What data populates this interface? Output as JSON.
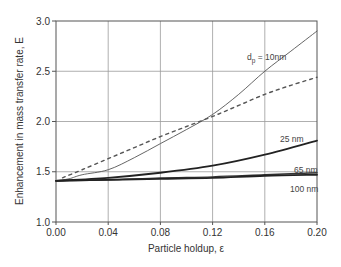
{
  "chart_data": {
    "type": "line",
    "title": "",
    "xlabel": "Particle holdup, ε",
    "ylabel": "Enhancement in mass transfer rate, E",
    "xlim": [
      0.0,
      0.2
    ],
    "ylim": [
      1.0,
      3.0
    ],
    "xticks": [
      "0.00",
      "0.04",
      "0.08",
      "0.12",
      "0.16",
      "0.20"
    ],
    "yticks": [
      "1.0",
      "1.5",
      "2.0",
      "2.5",
      "3.0"
    ],
    "grid": true,
    "legend": "inline labels at right end of curves",
    "series": [
      {
        "name": "d_p = 10nm",
        "style": "solid thin",
        "x": [
          0.0,
          0.01,
          0.02,
          0.04,
          0.06,
          0.08,
          0.1,
          0.12,
          0.14,
          0.16,
          0.18,
          0.2
        ],
        "y": [
          1.41,
          1.43,
          1.47,
          1.52,
          1.64,
          1.78,
          1.92,
          2.07,
          2.27,
          2.5,
          2.7,
          2.9
        ]
      },
      {
        "name": "dashed (reference)",
        "style": "dashed",
        "x": [
          0.005,
          0.02,
          0.04,
          0.06,
          0.08,
          0.1,
          0.12,
          0.14,
          0.16,
          0.18,
          0.2
        ],
        "y": [
          1.44,
          1.52,
          1.63,
          1.74,
          1.85,
          1.95,
          2.05,
          2.16,
          2.27,
          2.36,
          2.44
        ]
      },
      {
        "name": "25 nm",
        "style": "solid thick",
        "x": [
          0.0,
          0.04,
          0.08,
          0.12,
          0.16,
          0.2
        ],
        "y": [
          1.41,
          1.44,
          1.49,
          1.56,
          1.67,
          1.81
        ]
      },
      {
        "name": "65 nm",
        "style": "solid medium",
        "x": [
          0.0,
          0.04,
          0.08,
          0.12,
          0.16,
          0.2
        ],
        "y": [
          1.41,
          1.42,
          1.44,
          1.45,
          1.47,
          1.49
        ]
      },
      {
        "name": "100 nm",
        "style": "solid thick",
        "x": [
          0.0,
          0.04,
          0.08,
          0.12,
          0.16,
          0.2
        ],
        "y": [
          1.41,
          1.42,
          1.43,
          1.44,
          1.46,
          1.47
        ]
      }
    ],
    "labels": {
      "dp_prefix": "d",
      "dp_sub": "p",
      "dp_suffix": " = 10nm",
      "l25": "25 nm",
      "l65": "65 nm",
      "l100": "100 nm"
    }
  }
}
